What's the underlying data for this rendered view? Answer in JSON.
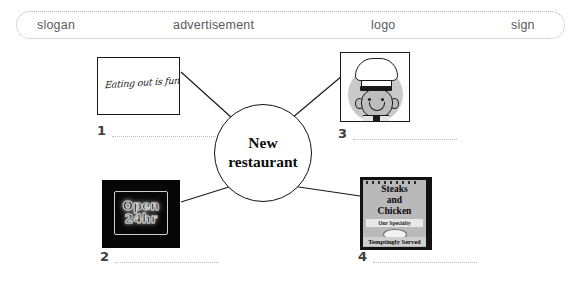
{
  "word_bank": {
    "items": [
      {
        "label": "slogan"
      },
      {
        "label": "advertisement"
      },
      {
        "label": "logo"
      },
      {
        "label": "sign"
      }
    ]
  },
  "center": {
    "line1": "New",
    "line2": "restaurant"
  },
  "cards": {
    "slogan": {
      "script_text": "Eating out is fun"
    },
    "neon": {
      "line1": "Open",
      "line2": "24hr"
    },
    "chef": {
      "alt": "cartoon chef with toque hat"
    },
    "sign": {
      "line1": "Steaks",
      "line2": "and",
      "line3": "Chicken",
      "specialty": "Our Specialty",
      "served": "Temptingly Served"
    }
  },
  "answers": [
    {
      "number": "1",
      "value": ""
    },
    {
      "number": "2",
      "value": ""
    },
    {
      "number": "3",
      "value": ""
    },
    {
      "number": "4",
      "value": ""
    }
  ],
  "colors": {
    "ink": "#111111",
    "muted": "#5b5b5b",
    "line": "#bdbdbd"
  }
}
